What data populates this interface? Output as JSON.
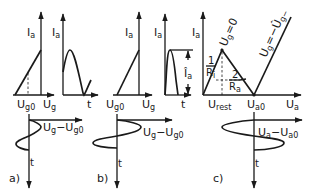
{
  "figure": {
    "panel_a": {
      "tag": "a)",
      "transfer": {
        "y_axis": "I",
        "y_axis_sub": "a",
        "x_label_1": "U",
        "x_label_1_sub": "g0",
        "x_label_2": "U",
        "x_label_2_sub": "g"
      },
      "output": {
        "y_axis": "I",
        "y_axis_sub": "a",
        "x_axis": "t"
      },
      "input": {
        "x_axis": "U",
        "x_axis_sub1": "g",
        "x_axis_mid": "−U",
        "x_axis_sub2": "g0",
        "t_axis": "t"
      }
    },
    "panel_b": {
      "tag": "b)",
      "transfer": {
        "y_axis": "I",
        "y_axis_sub": "a",
        "x_label_1": "U",
        "x_label_1_sub": "g0",
        "x_label_2": "U",
        "x_label_2_sub": "g"
      },
      "output": {
        "y_axis": "I",
        "y_axis_sub": "a",
        "x_axis": "t",
        "amplitude": "Î",
        "amplitude_sub": "a"
      },
      "input": {
        "x_axis": "U",
        "x_axis_sub1": "g",
        "x_axis_mid": "−U",
        "x_axis_sub2": "g0",
        "t_axis": "t"
      }
    },
    "panel_c": {
      "tag": "c)",
      "characteristic": {
        "y_axis": "I",
        "y_axis_sub": "a",
        "x_axis": "U",
        "x_axis_sub": "a",
        "x_label_rest": "U",
        "x_label_rest_sub": "rest",
        "x_label_a0": "U",
        "x_label_a0_sub": "a0",
        "curve_1": "U",
        "curve_1_sub": "g",
        "curve_1_rest": "=0",
        "curve_2": "U",
        "curve_2_sub": "g",
        "curve_2_rest": "=−Û",
        "curve_2_sub2": "g−",
        "slope_1_num": "1",
        "slope_1_den": "R",
        "slope_1_den_sub": "i",
        "slope_2_num": "2",
        "slope_2_den": "R",
        "slope_2_den_sub": "a"
      },
      "output": {
        "x_axis": "U",
        "x_axis_sub1": "a",
        "x_axis_mid": "−U",
        "x_axis_sub2": "a0",
        "t_axis": "t"
      }
    }
  }
}
